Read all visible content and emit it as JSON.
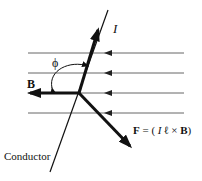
{
  "diagram": {
    "labels": {
      "current": "I",
      "field": "B",
      "angle": "ϕ",
      "force": "F = ( I ℓ × B)",
      "force_parts": {
        "F": "F",
        "eq": " = ( ",
        "I": "I",
        "l": " ℓ ",
        "times": "×",
        "B": " B",
        "close": ")"
      },
      "conductor": "Conductor"
    },
    "field_lines": {
      "count": 4,
      "direction": "left"
    },
    "colors": {
      "ink": "#111111",
      "field_line": "#555555",
      "background": "#ffffff"
    }
  }
}
